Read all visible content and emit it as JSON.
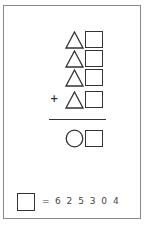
{
  "puzzle": {
    "rows": [
      {
        "shapes": [
          "triangle",
          "square"
        ],
        "operator": ""
      },
      {
        "shapes": [
          "triangle",
          "square"
        ],
        "operator": ""
      },
      {
        "shapes": [
          "triangle",
          "square"
        ],
        "operator": ""
      },
      {
        "shapes": [
          "triangle",
          "square"
        ],
        "operator": "+"
      }
    ],
    "result": {
      "shapes": [
        "circle",
        "square"
      ]
    },
    "clue": {
      "shape": "square",
      "equals_sign": "=",
      "options": "6 2 5 3 0 4"
    }
  },
  "colors": {
    "stroke": "#333333",
    "frame": "#8a8a8a",
    "background": "#ffffff"
  }
}
